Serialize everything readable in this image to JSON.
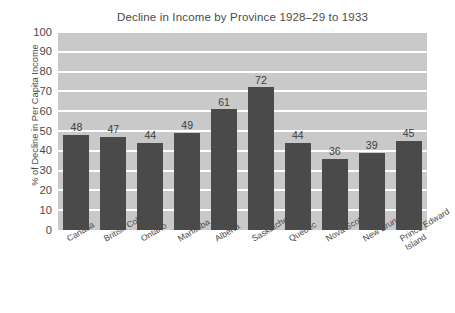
{
  "chart_data": {
    "type": "bar",
    "title": "Decline in Income by Province 1928–29 to 1933",
    "xlabel": "",
    "ylabel": "% of Decline in Per Capita Income",
    "categories": [
      "Canada",
      "British Columbia",
      "Ontario",
      "Manitoba",
      "Alberta",
      "Saskatchewan",
      "Quebec",
      "Nova Scotia",
      "New Brunswick",
      "Prince Edward Island"
    ],
    "values": [
      48,
      47,
      44,
      49,
      61,
      72,
      44,
      36,
      39,
      45
    ],
    "ylim": [
      0,
      100
    ],
    "ytick_labels": [
      "100",
      "90",
      "80",
      "70",
      "60",
      "50",
      "40",
      "30",
      "20",
      "10",
      "0"
    ],
    "ytick_values": [
      100,
      90,
      80,
      70,
      60,
      50,
      40,
      30,
      20,
      10,
      0
    ],
    "grid": true,
    "legend": false,
    "colors": {
      "bar": "#4a4a4a",
      "plot_background": "#c9c9c9",
      "gridline": "#ffffff",
      "text": "#4a4a4a",
      "page_background": "#ffffff"
    },
    "data_labels": [
      "48",
      "47",
      "44",
      "49",
      "61",
      "72",
      "44",
      "36",
      "39",
      "45"
    ],
    "category_label_lines": [
      [
        "Canada"
      ],
      [
        "British Columbia"
      ],
      [
        "Ontario"
      ],
      [
        "Manitoba"
      ],
      [
        "Alberta"
      ],
      [
        "Saskatchewan"
      ],
      [
        "Quebec"
      ],
      [
        "Nova Scotia"
      ],
      [
        "New Brunswick"
      ],
      [
        "Prince Edward",
        "Island"
      ]
    ]
  }
}
